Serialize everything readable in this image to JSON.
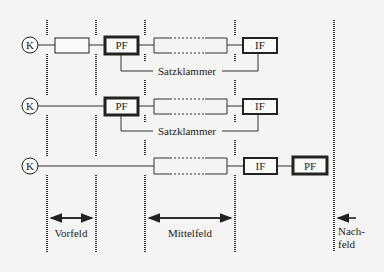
{
  "diagram": {
    "type": "topological field model",
    "rows": [
      {
        "id": "row-1",
        "k_label": "K",
        "vorfeld_box": "",
        "left_bracket": "PF",
        "mittelfeld": "",
        "right_bracket": "IF",
        "bracket_label": "Satzklammer"
      },
      {
        "id": "row-2",
        "k_label": "K",
        "left_bracket": "PF",
        "mittelfeld": "",
        "right_bracket": "IF",
        "bracket_label": "Satzklammer"
      },
      {
        "id": "row-3",
        "k_label": "K",
        "mittelfeld": "",
        "right_bracket_1": "IF",
        "right_bracket_2": "PF"
      }
    ],
    "fields": {
      "vorfeld": "Vorfeld",
      "mittelfeld": "Mittelfeld",
      "nachfeld_line1": "Nach-",
      "nachfeld_line2": "feld"
    },
    "colors": {
      "background": "#f4f4f2",
      "ink": "#222222"
    }
  }
}
